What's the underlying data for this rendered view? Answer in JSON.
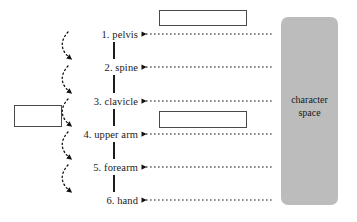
{
  "diagram": {
    "chain": {
      "name": "joint-chain",
      "items": [
        {
          "index": "1.",
          "label": "1. pelvis",
          "y": 34
        },
        {
          "index": "2.",
          "label": "2. spine",
          "y": 67
        },
        {
          "index": "3.",
          "label": "3. clavicle",
          "y": 101
        },
        {
          "index": "4.",
          "label": "4. upper arm",
          "y": 134
        },
        {
          "index": "5.",
          "label": "5. forearm",
          "y": 167
        },
        {
          "index": "6.",
          "label": "6. hand",
          "y": 200
        }
      ]
    },
    "character_space": {
      "line1": "character",
      "line2": "space",
      "fill_color": "#bcbcbc"
    },
    "boxes": [
      {
        "name": "top-empty-box",
        "text": ""
      },
      {
        "name": "middle-empty-box",
        "text": ""
      },
      {
        "name": "left-empty-box",
        "text": ""
      }
    ],
    "colors": {
      "line": "#111111",
      "box_border": "#4a4a4a",
      "text": "#1a1a1a",
      "gray_panel": "#bcbcbc",
      "background": "#ffffff"
    },
    "connectors": {
      "horizontal_dashed_arrows": 6,
      "curved_dotted_arrows": 5,
      "vertical_segments": 5
    }
  }
}
